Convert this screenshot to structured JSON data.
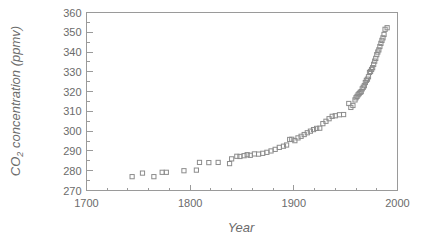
{
  "chart_data": {
    "type": "scatter",
    "title": "",
    "xlabel": "Year",
    "ylabel": "CO2 concentration (ppmv)",
    "ylabel_main": "CO",
    "ylabel_sub": "2",
    "ylabel_rest": " concentration (ppmv)",
    "xlim": [
      1700,
      2000
    ],
    "ylim": [
      270,
      360
    ],
    "x_major_ticks": [
      1700,
      1800,
      1900,
      2000
    ],
    "x_tick_labels": [
      "1700",
      "1800",
      "1900",
      "2000"
    ],
    "x_minor_step": 20,
    "y_major_ticks": [
      270,
      280,
      290,
      300,
      310,
      320,
      330,
      340,
      350,
      360
    ],
    "y_tick_labels": [
      "270",
      "280",
      "290",
      "300",
      "310",
      "320",
      "330",
      "340",
      "350",
      "360"
    ],
    "y_minor_step": 5,
    "grid": false,
    "legend": "none",
    "marker": "open-square",
    "marker_color": "#8c8c8c",
    "series": [
      {
        "name": "CO2 concentration",
        "points": [
          [
            1744,
            277.0
          ],
          [
            1754,
            278.8
          ],
          [
            1765,
            277.0
          ],
          [
            1773,
            279.2
          ],
          [
            1777,
            279.2
          ],
          [
            1794,
            280.0
          ],
          [
            1806,
            280.3
          ],
          [
            1809,
            284.2
          ],
          [
            1818,
            284.1
          ],
          [
            1827,
            284.2
          ],
          [
            1838,
            283.6
          ],
          [
            1840,
            286.0
          ],
          [
            1845,
            287.3
          ],
          [
            1848,
            287.2
          ],
          [
            1852,
            287.6
          ],
          [
            1855,
            288.1
          ],
          [
            1858,
            287.8
          ],
          [
            1862,
            288.5
          ],
          [
            1866,
            288.4
          ],
          [
            1870,
            288.8
          ],
          [
            1874,
            289.3
          ],
          [
            1878,
            290.0
          ],
          [
            1882,
            290.8
          ],
          [
            1886,
            291.8
          ],
          [
            1890,
            292.4
          ],
          [
            1893,
            293.0
          ],
          [
            1896,
            295.8
          ],
          [
            1898,
            295.9
          ],
          [
            1901,
            295.2
          ],
          [
            1904,
            296.6
          ],
          [
            1907,
            297.4
          ],
          [
            1910,
            298.3
          ],
          [
            1913,
            299.2
          ],
          [
            1916,
            300.0
          ],
          [
            1919,
            300.8
          ],
          [
            1922,
            301.4
          ],
          [
            1925,
            301.5
          ],
          [
            1928,
            303.8
          ],
          [
            1931,
            305.0
          ],
          [
            1934,
            306.3
          ],
          [
            1937,
            307.5
          ],
          [
            1940,
            307.8
          ],
          [
            1944,
            308.3
          ],
          [
            1948,
            308.4
          ],
          [
            1953,
            314.0
          ],
          [
            1955,
            312.0
          ],
          [
            1957,
            313.0
          ],
          [
            1959,
            315.8
          ],
          [
            1960,
            316.9
          ],
          [
            1961,
            317.6
          ],
          [
            1962,
            318.4
          ],
          [
            1963,
            319.0
          ],
          [
            1964,
            319.6
          ],
          [
            1965,
            320.0
          ],
          [
            1966,
            321.4
          ],
          [
            1967,
            322.2
          ],
          [
            1968,
            323.0
          ],
          [
            1969,
            324.6
          ],
          [
            1970,
            325.7
          ],
          [
            1971,
            326.3
          ],
          [
            1972,
            327.5
          ],
          [
            1973,
            329.7
          ],
          [
            1974,
            330.2
          ],
          [
            1975,
            331.2
          ],
          [
            1976,
            332.1
          ],
          [
            1977,
            333.8
          ],
          [
            1978,
            335.4
          ],
          [
            1979,
            336.8
          ],
          [
            1980,
            338.7
          ],
          [
            1981,
            340.0
          ],
          [
            1982,
            341.1
          ],
          [
            1983,
            342.8
          ],
          [
            1984,
            344.4
          ],
          [
            1985,
            345.9
          ],
          [
            1986,
            347.2
          ],
          [
            1987,
            348.9
          ],
          [
            1988,
            351.5
          ],
          [
            1990,
            352.3
          ]
        ]
      }
    ]
  }
}
